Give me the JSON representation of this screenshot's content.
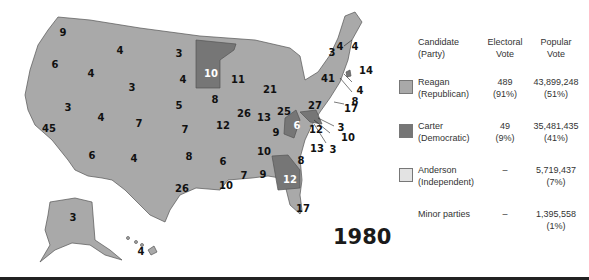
{
  "title_year": "1980",
  "legend": {
    "headers": {
      "candidate": [
        "Candidate",
        "(Party)"
      ],
      "electoral": [
        "Electoral",
        "Vote"
      ],
      "popular": [
        "Popular",
        "Vote"
      ]
    },
    "rows": [
      {
        "name": "Reagan",
        "party": "(Republican)",
        "electoral": "489",
        "electoral_pct": "(91%)",
        "popular": "43,899,248",
        "popular_pct": "(51%)",
        "color": "#a9a9a9"
      },
      {
        "name": "Carter",
        "party": "(Democratic)",
        "electoral": "49",
        "electoral_pct": "(9%)",
        "popular": "35,481,435",
        "popular_pct": "(41%)",
        "color": "#767676"
      },
      {
        "name": "Anderson",
        "party": "(Independent)",
        "electoral": "–",
        "electoral_pct": "",
        "popular": "5,719,437",
        "popular_pct": "(7%)",
        "color": "#e3e3e3"
      },
      {
        "name": "Minor parties",
        "party": "",
        "electoral": "–",
        "electoral_pct": "",
        "popular": "1,395,558",
        "popular_pct": "(1%)",
        "color": ""
      }
    ]
  },
  "states": {
    "WA": "9",
    "OR": "6",
    "CA": "45",
    "ID": "4",
    "NV": "3",
    "MT": "4",
    "WY": "3",
    "UT": "4",
    "AZ": "6",
    "CO": "7",
    "NM": "4",
    "ND": "3",
    "SD": "4",
    "NE": "5",
    "KS": "7",
    "OK": "8",
    "TX": "26",
    "MN": "10",
    "IA": "8",
    "MO": "12",
    "AR": "6",
    "LA": "10",
    "WI": "11",
    "IL": "26",
    "MI": "21",
    "IN": "13",
    "OH": "25",
    "KY": "9",
    "TN": "10",
    "MS": "7",
    "AL": "9",
    "GA": "12",
    "FL": "17",
    "SC": "8",
    "NC": "13",
    "VA": "12",
    "WV": "6",
    "PA": "27",
    "NY": "41",
    "VT": "3",
    "NH": "4",
    "ME": "4",
    "MA": "14",
    "RI": "4",
    "CT": "8",
    "NJ": "17",
    "DE": "3",
    "MD": "10",
    "DC": "3",
    "AK": "3",
    "HI": "4"
  },
  "colors": {
    "republican": "#a9a9a9",
    "democratic": "#767676",
    "independent": "#e3e3e3"
  }
}
